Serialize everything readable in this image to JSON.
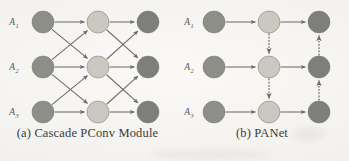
{
  "figure": {
    "background_color": "#f3f2ef",
    "row_labels": [
      {
        "base": "A",
        "sub": "1"
      },
      {
        "base": "A",
        "sub": "2"
      },
      {
        "base": "A",
        "sub": "3"
      }
    ],
    "node_colors": {
      "input": "#8a8a85",
      "middle": "#c8c8c0",
      "output": "#7a7a78",
      "stroke": "#6e6e6a"
    },
    "edge_color": "#6b6b68",
    "geometry": {
      "node_radius": 11,
      "row_y": [
        22,
        67,
        112
      ],
      "panel_a_col_x": [
        43,
        98,
        148
      ],
      "panel_b_col_x": [
        39,
        94,
        144
      ],
      "label_x": 14
    }
  },
  "panels": [
    {
      "id": "panel-a",
      "caption": "(a) Cascade PConv Module",
      "columns": [
        {
          "name": "input-column",
          "color_key": "input"
        },
        {
          "name": "middle-column",
          "color_key": "middle"
        },
        {
          "name": "output-column",
          "color_key": "output"
        }
      ],
      "edges": [
        {
          "from_col": 0,
          "from_row": 0,
          "to_col": 1,
          "to_row": 0,
          "style": "solid"
        },
        {
          "from_col": 0,
          "from_row": 0,
          "to_col": 1,
          "to_row": 1,
          "style": "solid"
        },
        {
          "from_col": 0,
          "from_row": 1,
          "to_col": 1,
          "to_row": 0,
          "style": "solid"
        },
        {
          "from_col": 0,
          "from_row": 1,
          "to_col": 1,
          "to_row": 1,
          "style": "solid"
        },
        {
          "from_col": 0,
          "from_row": 1,
          "to_col": 1,
          "to_row": 2,
          "style": "solid"
        },
        {
          "from_col": 0,
          "from_row": 2,
          "to_col": 1,
          "to_row": 1,
          "style": "solid"
        },
        {
          "from_col": 0,
          "from_row": 2,
          "to_col": 1,
          "to_row": 2,
          "style": "solid"
        },
        {
          "from_col": 1,
          "from_row": 0,
          "to_col": 2,
          "to_row": 0,
          "style": "solid"
        },
        {
          "from_col": 1,
          "from_row": 0,
          "to_col": 2,
          "to_row": 1,
          "style": "solid"
        },
        {
          "from_col": 1,
          "from_row": 1,
          "to_col": 2,
          "to_row": 0,
          "style": "solid"
        },
        {
          "from_col": 1,
          "from_row": 1,
          "to_col": 2,
          "to_row": 1,
          "style": "solid"
        },
        {
          "from_col": 1,
          "from_row": 1,
          "to_col": 2,
          "to_row": 2,
          "style": "solid"
        },
        {
          "from_col": 1,
          "from_row": 2,
          "to_col": 2,
          "to_row": 1,
          "style": "solid"
        },
        {
          "from_col": 1,
          "from_row": 2,
          "to_col": 2,
          "to_row": 2,
          "style": "solid"
        }
      ]
    },
    {
      "id": "panel-b",
      "caption": "(b) PANet",
      "columns": [
        {
          "name": "input-column",
          "color_key": "input"
        },
        {
          "name": "middle-column",
          "color_key": "middle"
        },
        {
          "name": "output-column",
          "color_key": "output"
        }
      ],
      "edges": [
        {
          "from_col": 0,
          "from_row": 0,
          "to_col": 1,
          "to_row": 0,
          "style": "solid"
        },
        {
          "from_col": 0,
          "from_row": 1,
          "to_col": 1,
          "to_row": 1,
          "style": "solid"
        },
        {
          "from_col": 0,
          "from_row": 2,
          "to_col": 1,
          "to_row": 2,
          "style": "solid"
        },
        {
          "from_col": 1,
          "from_row": 0,
          "to_col": 2,
          "to_row": 0,
          "style": "solid"
        },
        {
          "from_col": 1,
          "from_row": 1,
          "to_col": 2,
          "to_row": 1,
          "style": "solid"
        },
        {
          "from_col": 1,
          "from_row": 2,
          "to_col": 2,
          "to_row": 2,
          "style": "solid"
        },
        {
          "from_col": 1,
          "from_row": 0,
          "to_col": 1,
          "to_row": 1,
          "style": "dashed"
        },
        {
          "from_col": 1,
          "from_row": 1,
          "to_col": 1,
          "to_row": 2,
          "style": "dashed"
        },
        {
          "from_col": 2,
          "from_row": 2,
          "to_col": 2,
          "to_row": 1,
          "style": "dashed"
        },
        {
          "from_col": 2,
          "from_row": 1,
          "to_col": 2,
          "to_row": 0,
          "style": "dashed"
        }
      ]
    }
  ]
}
